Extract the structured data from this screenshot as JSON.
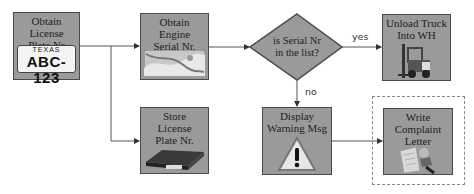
{
  "nodes": {
    "obtain_plate": {
      "label": "Obtain\nLicense\nPlate Nr",
      "image": "license-plate",
      "plate_state": "TEXAS",
      "plate_number": "ABC-123"
    },
    "obtain_serial": {
      "label": "Obtain\nEngine\nSerial Nr.",
      "image": "engine-photo"
    },
    "decision": {
      "label": "is Serial Nr\nin the list?"
    },
    "unload_truck": {
      "label": "Unload Truck\nInto WH",
      "image": "forklift"
    },
    "store_plate": {
      "label": "Store\nLicense\nPlate Nr.",
      "image": "binder"
    },
    "display_warning": {
      "label": "Display\nWarning Msg",
      "image": "warning-sign"
    },
    "write_letter": {
      "label": "Write\nComplaint\nLetter",
      "image": "letter-writing"
    }
  },
  "edges": {
    "yes_label": "yes",
    "no_label": "no"
  },
  "colors": {
    "node_fill": "#9a9a9a",
    "node_border": "#4a4a4a",
    "line": "#555555",
    "dashed_border": "#888888"
  }
}
